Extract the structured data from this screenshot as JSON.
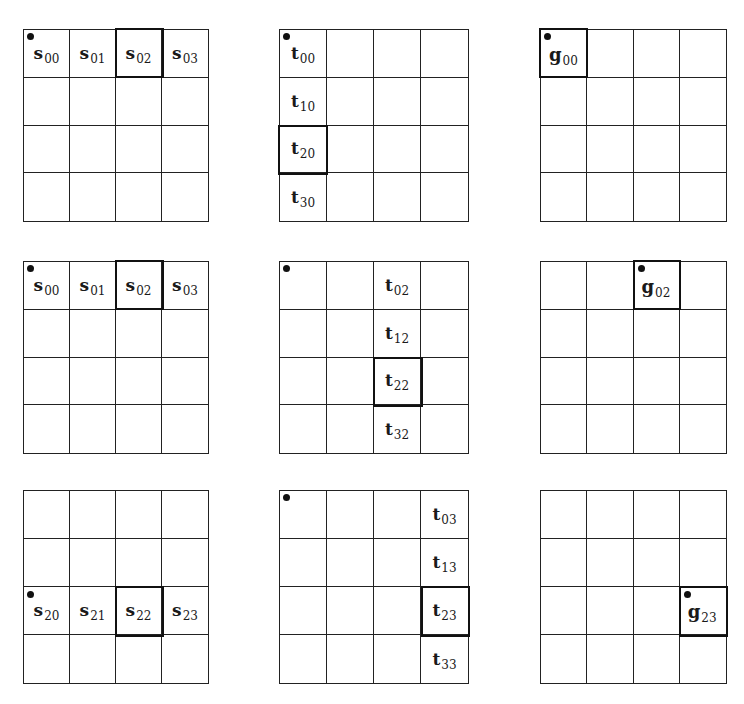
{
  "figure": {
    "grid_size": 4,
    "line_color": "#222222",
    "panels": [
      {
        "id": "s-row0",
        "row": 0,
        "col": 0,
        "x": 23,
        "y": 29,
        "w": 186,
        "h": 193,
        "dot": {
          "r": 0,
          "c": 0
        },
        "highlight": {
          "r": 0,
          "c": 2
        },
        "labels": [
          {
            "r": 0,
            "c": 0,
            "base": "s",
            "sub": "00"
          },
          {
            "r": 0,
            "c": 1,
            "base": "s",
            "sub": "01"
          },
          {
            "r": 0,
            "c": 2,
            "base": "s",
            "sub": "02"
          },
          {
            "r": 0,
            "c": 3,
            "base": "s",
            "sub": "03"
          }
        ]
      },
      {
        "id": "t-col0",
        "row": 0,
        "col": 1,
        "x": 279,
        "y": 29,
        "w": 190,
        "h": 193,
        "dot": {
          "r": 0,
          "c": 0
        },
        "highlight": {
          "r": 2,
          "c": 0
        },
        "labels": [
          {
            "r": 0,
            "c": 0,
            "base": "t",
            "sub": "00"
          },
          {
            "r": 1,
            "c": 0,
            "base": "t",
            "sub": "10"
          },
          {
            "r": 2,
            "c": 0,
            "base": "t",
            "sub": "20"
          },
          {
            "r": 3,
            "c": 0,
            "base": "t",
            "sub": "30"
          }
        ]
      },
      {
        "id": "g-00",
        "row": 0,
        "col": 2,
        "x": 540,
        "y": 29,
        "w": 187,
        "h": 193,
        "dot": {
          "r": 0,
          "c": 0
        },
        "highlight": {
          "r": 0,
          "c": 0
        },
        "labels": [
          {
            "r": 0,
            "c": 0,
            "base": "g",
            "sub": "00",
            "corner": true
          }
        ]
      },
      {
        "id": "s-row0-b",
        "row": 1,
        "col": 0,
        "x": 23,
        "y": 261,
        "w": 186,
        "h": 193,
        "dot": {
          "r": 0,
          "c": 0
        },
        "highlight": {
          "r": 0,
          "c": 2
        },
        "labels": [
          {
            "r": 0,
            "c": 0,
            "base": "s",
            "sub": "00"
          },
          {
            "r": 0,
            "c": 1,
            "base": "s",
            "sub": "01"
          },
          {
            "r": 0,
            "c": 2,
            "base": "s",
            "sub": "02"
          },
          {
            "r": 0,
            "c": 3,
            "base": "s",
            "sub": "03"
          }
        ]
      },
      {
        "id": "t-col2",
        "row": 1,
        "col": 1,
        "x": 279,
        "y": 261,
        "w": 190,
        "h": 193,
        "dot": {
          "r": 0,
          "c": 0
        },
        "highlight": {
          "r": 2,
          "c": 2
        },
        "labels": [
          {
            "r": 0,
            "c": 2,
            "base": "t",
            "sub": "02"
          },
          {
            "r": 1,
            "c": 2,
            "base": "t",
            "sub": "12"
          },
          {
            "r": 2,
            "c": 2,
            "base": "t",
            "sub": "22"
          },
          {
            "r": 3,
            "c": 2,
            "base": "t",
            "sub": "32"
          }
        ]
      },
      {
        "id": "g-02",
        "row": 1,
        "col": 2,
        "x": 540,
        "y": 261,
        "w": 187,
        "h": 193,
        "dot": {
          "r": 0,
          "c": 2
        },
        "highlight": {
          "r": 0,
          "c": 2
        },
        "labels": [
          {
            "r": 0,
            "c": 2,
            "base": "g",
            "sub": "02",
            "corner": true
          }
        ]
      },
      {
        "id": "s-row2",
        "row": 2,
        "col": 0,
        "x": 23,
        "y": 490,
        "w": 186,
        "h": 194,
        "dot": {
          "r": 2,
          "c": 0
        },
        "highlight": {
          "r": 2,
          "c": 2
        },
        "labels": [
          {
            "r": 2,
            "c": 0,
            "base": "s",
            "sub": "20"
          },
          {
            "r": 2,
            "c": 1,
            "base": "s",
            "sub": "21"
          },
          {
            "r": 2,
            "c": 2,
            "base": "s",
            "sub": "22"
          },
          {
            "r": 2,
            "c": 3,
            "base": "s",
            "sub": "23"
          }
        ]
      },
      {
        "id": "t-col3",
        "row": 2,
        "col": 1,
        "x": 279,
        "y": 490,
        "w": 190,
        "h": 194,
        "dot": {
          "r": 0,
          "c": 0
        },
        "highlight": {
          "r": 2,
          "c": 3
        },
        "labels": [
          {
            "r": 0,
            "c": 3,
            "base": "t",
            "sub": "03"
          },
          {
            "r": 1,
            "c": 3,
            "base": "t",
            "sub": "13"
          },
          {
            "r": 2,
            "c": 3,
            "base": "t",
            "sub": "23"
          },
          {
            "r": 3,
            "c": 3,
            "base": "t",
            "sub": "33"
          }
        ]
      },
      {
        "id": "g-23",
        "row": 2,
        "col": 2,
        "x": 540,
        "y": 490,
        "w": 187,
        "h": 194,
        "dot": {
          "r": 2,
          "c": 3
        },
        "highlight": {
          "r": 2,
          "c": 3
        },
        "labels": [
          {
            "r": 2,
            "c": 3,
            "base": "g",
            "sub": "23",
            "corner": true
          }
        ]
      }
    ]
  }
}
